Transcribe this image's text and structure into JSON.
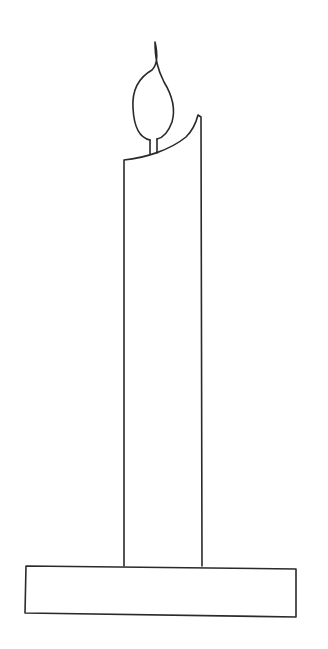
{
  "drawing": {
    "subject": "candle",
    "background_color": "#ffffff",
    "stroke_color": "#2a2a2a",
    "parts": [
      "flame",
      "wick",
      "candle-body",
      "candle-holder-base"
    ]
  }
}
